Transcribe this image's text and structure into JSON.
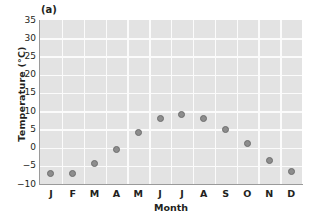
{
  "figure": {
    "panel_label": "(a)",
    "background_color": "#ffffff",
    "plot_background_color": "#e3e3e3",
    "gridline_color": "#fbfbfb",
    "marker_color": "#8d8d8d",
    "marker_edge_color": "#6e6e6e",
    "axis_color": "#9a9a9a"
  },
  "chart_data": {
    "type": "scatter",
    "title": "(a)",
    "xlabel": "Month",
    "ylabel": "Temperature (°C)",
    "categories": [
      "J",
      "F",
      "M",
      "A",
      "M",
      "J",
      "J",
      "A",
      "S",
      "O",
      "N",
      "D"
    ],
    "category_names": [
      "January",
      "February",
      "March",
      "April",
      "May",
      "June",
      "July",
      "August",
      "September",
      "October",
      "November",
      "December"
    ],
    "values": [
      -7,
      -7,
      -4.5,
      -0.5,
      4,
      8,
      9,
      8,
      5,
      1,
      -3.5,
      -6.5
    ],
    "ylim": [
      -10,
      35
    ],
    "yticks": [
      35,
      30,
      25,
      20,
      15,
      10,
      5,
      0,
      -5,
      -10
    ],
    "ytick_labels": [
      "35",
      "30",
      "25",
      "20",
      "15",
      "10",
      "5",
      "0",
      "−5",
      "−10"
    ],
    "grid": true,
    "legend": false,
    "legend_position": "none"
  }
}
